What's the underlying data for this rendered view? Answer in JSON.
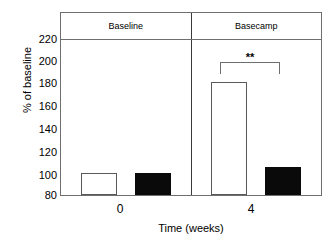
{
  "chart_data": {
    "type": "bar",
    "title": "",
    "subtitle": "",
    "xlabel": "Time (weeks)",
    "ylabel": "% of baseline",
    "categories": [
      "0",
      "4"
    ],
    "panels": [
      {
        "label": "Baseline",
        "category": "0"
      },
      {
        "label": "Basecamp",
        "category": "4"
      }
    ],
    "series": [
      {
        "name": "open",
        "fill": "#ffffff",
        "values": [
          100,
          181
        ]
      },
      {
        "name": "filled",
        "fill": "#000000",
        "values": [
          100,
          105
        ]
      }
    ],
    "yticks": [
      220,
      200,
      180,
      160,
      140,
      120,
      100,
      80
    ],
    "ylim": [
      80,
      220
    ],
    "ytick_step": 20,
    "xtick_labels": [
      "0",
      "4"
    ],
    "grid": false,
    "legend": "none",
    "annotations": [
      {
        "text": "**",
        "type": "significance-bracket",
        "panel": "Basecamp",
        "between": [
          "open",
          "filled"
        ],
        "y": 205
      }
    ]
  },
  "axis": {
    "y_title": "% of baseline",
    "x_title": "Time (weeks)"
  },
  "significance": {
    "stars": "**"
  },
  "colors": {
    "frame": "#6e6e6e",
    "divider": "#3a3a3a",
    "bar_open_fill": "#ffffff",
    "bar_open_stroke": "#5a5a5a",
    "bar_filled_fill": "#0a0a0a",
    "text": "#000000",
    "background": "#ffffff"
  }
}
